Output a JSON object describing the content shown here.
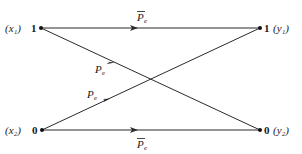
{
  "diagram": {
    "type": "binary symmetric channel",
    "inputs": [
      {
        "label": "(x₁)",
        "symbol": "1"
      },
      {
        "label": "(x₂)",
        "symbol": "0"
      }
    ],
    "outputs": [
      {
        "label": "(y₁)",
        "symbol": "1"
      },
      {
        "label": "(y₂)",
        "symbol": "0"
      }
    ],
    "edges": [
      {
        "from": "x1",
        "to": "y1",
        "label": "P",
        "sub": "e",
        "overbar": true
      },
      {
        "from": "x1",
        "to": "y2",
        "label": "P",
        "sub": "e",
        "overbar": false
      },
      {
        "from": "x2",
        "to": "y1",
        "label": "P",
        "sub": "e",
        "overbar": false
      },
      {
        "from": "x2",
        "to": "y2",
        "label": "P",
        "sub": "e",
        "overbar": true
      }
    ],
    "colors": {
      "stroke": "#2a2a2a",
      "text": "#1a1a1a",
      "background": "#ffffff"
    }
  }
}
